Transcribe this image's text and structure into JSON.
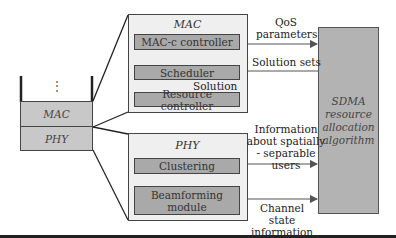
{
  "stack": {
    "ellipsis": "⋮",
    "layers": [
      {
        "label": "MAC"
      },
      {
        "label": "PHY"
      }
    ]
  },
  "mac_panel": {
    "title": "MAC",
    "blocks": [
      {
        "label": "MAC-c controller"
      },
      {
        "label": "Scheduler"
      },
      {
        "label": "Resource controller"
      }
    ],
    "internal_arrow_label": "Solution"
  },
  "phy_panel": {
    "title": "PHY",
    "blocks": [
      {
        "label": "Clustering"
      },
      {
        "label": "Beamforming module"
      }
    ]
  },
  "sdma_block": {
    "label": "SDMA resource allocation algorithm"
  },
  "connections": [
    {
      "label": "QoS parameters",
      "from": "MAC-c controller",
      "to": "SDMA resource allocation algorithm"
    },
    {
      "label": "Solution sets",
      "from": "SDMA resource allocation algorithm",
      "to": "Scheduler"
    },
    {
      "label": "Information about spatially - separable users",
      "from": "Clustering",
      "to": "SDMA resource allocation algorithm"
    },
    {
      "label": "Channel state information",
      "from": "Beamforming module",
      "to": "SDMA resource allocation algorithm"
    }
  ],
  "colors": {
    "panel_bg": "#efefef",
    "block_bg": "#a9a9a9",
    "stack_bg": "#c8c8c8",
    "sdma_bg": "#b3b3b3",
    "line": "#444444"
  }
}
